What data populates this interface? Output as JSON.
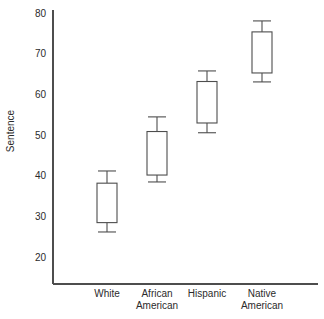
{
  "chart_data": {
    "type": "box",
    "title": "",
    "subtitle": "",
    "xlabel": "",
    "ylabel": "Sentence",
    "categories": [
      "White",
      "African American",
      "Hispanic",
      "Native American"
    ],
    "category_lines": [
      [
        "White"
      ],
      [
        "African",
        "American"
      ],
      [
        "Hispanic"
      ],
      [
        "Native",
        "American"
      ]
    ],
    "ylim": [
      14,
      82
    ],
    "yticks": [
      20,
      30,
      40,
      50,
      60,
      70,
      80
    ],
    "ytick_labels": [
      "20",
      "30",
      "40",
      "50",
      "60",
      "70",
      "80"
    ],
    "grid": false,
    "legend": null,
    "boxes": [
      {
        "category": "White",
        "whisker_low": 26.4,
        "q1": 28.7,
        "q3": 38.4,
        "whisker_high": 41.4,
        "median": null
      },
      {
        "category": "African American",
        "whisker_low": 38.7,
        "q1": 40.4,
        "q3": 51.1,
        "whisker_high": 54.7,
        "median": null
      },
      {
        "category": "Hispanic",
        "whisker_low": 50.8,
        "q1": 53.2,
        "q3": 63.4,
        "whisker_high": 66.0,
        "median": null
      },
      {
        "category": "Native American",
        "whisker_low": 63.3,
        "q1": 65.5,
        "q3": 75.6,
        "whisker_high": 78.3,
        "median": null
      }
    ],
    "colors": {
      "background": "#ffffff",
      "line": "#4d4d4d",
      "box_fill": "#ffffff",
      "text": "#2b2b2b"
    }
  }
}
